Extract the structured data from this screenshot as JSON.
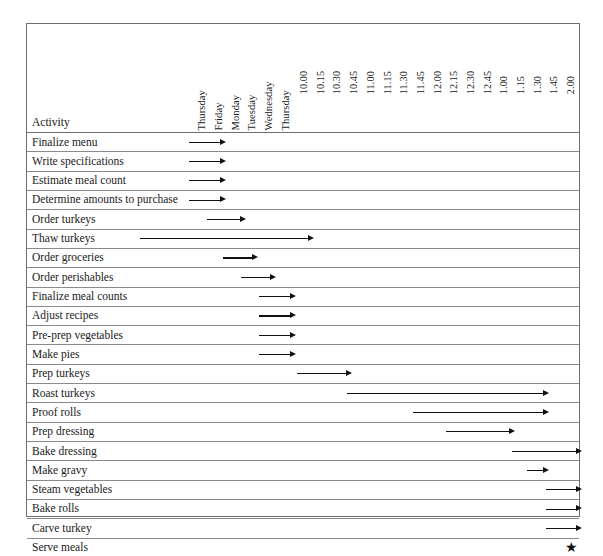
{
  "chart_data": {
    "type": "bar",
    "subtype": "gantt",
    "title": "",
    "xlabel": "",
    "ylabel": "",
    "activity_column_header": "Activity",
    "milestone_glyph": "★",
    "day_axis_labels": [
      "Thursday",
      "Friday",
      "Monday",
      "Tuesday",
      "Wednesday",
      "Thursday"
    ],
    "time_axis_labels": [
      "10.00",
      "10.15",
      "10.30",
      "10.45",
      "11.00",
      "11.15",
      "11.30",
      "11.45",
      "12.00",
      "12.15",
      "12.30",
      "12.45",
      "1.00",
      "1.15",
      "1.30",
      "1.45",
      "2.00"
    ],
    "axis_tick_x_px": {
      "days": [
        206,
        223,
        240,
        256,
        273,
        290
      ],
      "times": [
        308,
        325,
        341,
        358,
        375,
        392,
        408,
        425,
        442,
        458,
        475,
        492,
        508,
        525,
        542,
        558,
        575
      ]
    },
    "categories": [
      "Finalize menu",
      "Write specifications",
      "Estimate meal count",
      "Determine amounts to purchase",
      "Order turkeys",
      "Thaw turkeys",
      "Order groceries",
      "Order perishables",
      "Finalize meal counts",
      "Adjust recipes",
      "Pre-prep vegetables",
      "Make pies",
      "Prep turkeys",
      "Roast turkeys",
      "Proof rolls",
      "Prep dressing",
      "Bake dressing",
      "Make gravy",
      "Steam vegetables",
      "Bake rolls",
      "Carve turkey",
      "Serve meals"
    ],
    "tasks": [
      {
        "activity": "Finalize menu",
        "start_px": 188,
        "end_px": 220,
        "kind": "arrow"
      },
      {
        "activity": "Write specifications",
        "start_px": 188,
        "end_px": 220,
        "kind": "arrow"
      },
      {
        "activity": "Estimate meal count",
        "start_px": 188,
        "end_px": 220,
        "kind": "arrow"
      },
      {
        "activity": "Determine amounts to purchase",
        "start_px": 188,
        "end_px": 220,
        "kind": "arrow"
      },
      {
        "activity": "Order turkeys",
        "start_px": 206,
        "end_px": 240,
        "kind": "arrow"
      },
      {
        "activity": "Thaw turkeys",
        "start_px": 139,
        "end_px": 308,
        "kind": "arrow"
      },
      {
        "activity": "Order groceries",
        "start_px": 222,
        "end_px": 252,
        "kind": "arrow"
      },
      {
        "activity": "Order perishables",
        "start_px": 240,
        "end_px": 270,
        "kind": "arrow"
      },
      {
        "activity": "Finalize meal counts",
        "start_px": 258,
        "end_px": 290,
        "kind": "arrow"
      },
      {
        "activity": "Adjust recipes",
        "start_px": 258,
        "end_px": 290,
        "kind": "arrow"
      },
      {
        "activity": "Pre-prep vegetables",
        "start_px": 258,
        "end_px": 290,
        "kind": "arrow"
      },
      {
        "activity": "Make pies",
        "start_px": 258,
        "end_px": 290,
        "kind": "arrow"
      },
      {
        "activity": "Prep turkeys",
        "start_px": 296,
        "end_px": 346,
        "kind": "arrow"
      },
      {
        "activity": "Roast turkeys",
        "start_px": 346,
        "end_px": 543,
        "kind": "arrow"
      },
      {
        "activity": "Proof rolls",
        "start_px": 412,
        "end_px": 543,
        "kind": "arrow"
      },
      {
        "activity": "Prep dressing",
        "start_px": 445,
        "end_px": 509,
        "kind": "arrow"
      },
      {
        "activity": "Bake dressing",
        "start_px": 511,
        "end_px": 576,
        "kind": "arrow"
      },
      {
        "activity": "Make gravy",
        "start_px": 526,
        "end_px": 543,
        "kind": "arrow"
      },
      {
        "activity": "Steam vegetables",
        "start_px": 545,
        "end_px": 576,
        "kind": "arrow"
      },
      {
        "activity": "Bake rolls",
        "start_px": 545,
        "end_px": 576,
        "kind": "arrow"
      },
      {
        "activity": "Carve turkey",
        "start_px": 545,
        "end_px": 576,
        "kind": "arrow"
      },
      {
        "activity": "Serve meals",
        "start_px": 570,
        "end_px": 570,
        "kind": "milestone"
      }
    ],
    "grid": true,
    "legend": "none"
  },
  "caption": {
    "text": ""
  },
  "colors": {
    "frame": "#6e6e6e",
    "gridline": "#8a8a8a",
    "bar": "#111111",
    "text": "#1a1a1a",
    "background": "#ffffff"
  }
}
